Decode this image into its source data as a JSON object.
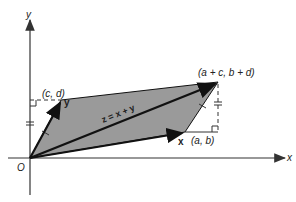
{
  "diagram": {
    "type": "vector-addition-parallelogram",
    "axes": {
      "x_label": "x",
      "y_label": "y",
      "origin_label": "O"
    },
    "points": {
      "origin": {
        "label": "O"
      },
      "x_tip": {
        "label": "(a, b)"
      },
      "y_tip": {
        "label": "(c, d)"
      },
      "sum_tip": {
        "label": "(a + c, b + d)"
      }
    },
    "vectors": {
      "x": {
        "label": "x"
      },
      "y": {
        "label": "y"
      },
      "z": {
        "label": "z = x + y"
      }
    },
    "colors": {
      "parallelogram_fill": "#9a9a9a",
      "line": "#1a1a1a",
      "axis": "#333333"
    }
  }
}
